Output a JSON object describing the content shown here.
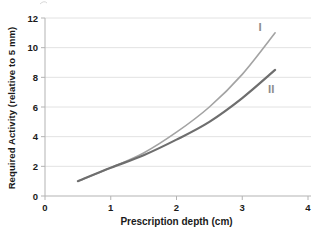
{
  "chart_data": {
    "type": "line",
    "title": "",
    "xlabel": "Prescription depth (cm)",
    "ylabel": "Required Activity (relative to 5 mm)",
    "xlim": [
      0,
      4
    ],
    "ylim": [
      0,
      12
    ],
    "xticks": [
      "0",
      "1",
      "2",
      "3",
      "4"
    ],
    "yticks": [
      "0",
      "2",
      "4",
      "6",
      "8",
      "10",
      "12"
    ],
    "grid": "horizontal-only",
    "legend": "inline-labels-at-curve-ends",
    "x": [
      0.5,
      1.0,
      1.5,
      2.0,
      2.5,
      3.0,
      3.5
    ],
    "series": [
      {
        "name": "I",
        "values": [
          1.0,
          1.9,
          2.9,
          4.3,
          6.0,
          8.2,
          11.0
        ],
        "color": "#a3a3a3",
        "width": 1.6,
        "label_anchor": {
          "x": 3.27,
          "y": 11.15
        }
      },
      {
        "name": "II",
        "values": [
          1.0,
          1.9,
          2.75,
          3.8,
          5.0,
          6.6,
          8.5
        ],
        "color": "#6e6e6e",
        "width": 2.2,
        "label_anchor": {
          "x": 3.44,
          "y": 6.95
        }
      }
    ],
    "colors": {
      "background": "#ffffff",
      "axis": "#b3b3b3",
      "grid": "#e2e2e2",
      "tick_text": "#1a1a1a",
      "series_label": "#8c8c8c"
    }
  }
}
